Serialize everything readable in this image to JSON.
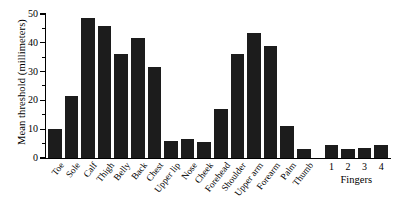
{
  "chart_data": {
    "type": "bar",
    "title": "",
    "xlabel": "",
    "ylabel": "Mean threshold (millimeters)",
    "ylim": [
      0,
      50
    ],
    "yticks": [
      0,
      10,
      20,
      30,
      40,
      50
    ],
    "ytick_labels": [
      "0",
      "10",
      "20",
      "30",
      "40",
      "50"
    ],
    "minor_tick_step": 5,
    "grid": false,
    "legend": null,
    "bar_color": "#1c1c1c",
    "categories": [
      "Toe",
      "Sole",
      "Calf",
      "Thigh",
      "Belly",
      "Back",
      "Chest",
      "Upper lip",
      "Nose",
      "Cheek",
      "Forehead",
      "Shoulder",
      "Upper arm",
      "Forearm",
      "Palm",
      "Thumb",
      "1",
      "2",
      "3",
      "4"
    ],
    "values": [
      10,
      21.5,
      48.5,
      46,
      36,
      41.5,
      31.5,
      6,
      6.5,
      5.5,
      17,
      36,
      43.5,
      39,
      11,
      3,
      4.5,
      3,
      3.5,
      4.5
    ],
    "label_orientation": [
      "rotated",
      "rotated",
      "rotated",
      "rotated",
      "rotated",
      "rotated",
      "rotated",
      "rotated",
      "rotated",
      "rotated",
      "rotated",
      "rotated",
      "rotated",
      "rotated",
      "rotated",
      "rotated",
      "horizontal",
      "horizontal",
      "horizontal",
      "horizontal"
    ],
    "groups": [
      {
        "label": "Fingers",
        "start_index": 16,
        "end_index": 19
      }
    ]
  }
}
